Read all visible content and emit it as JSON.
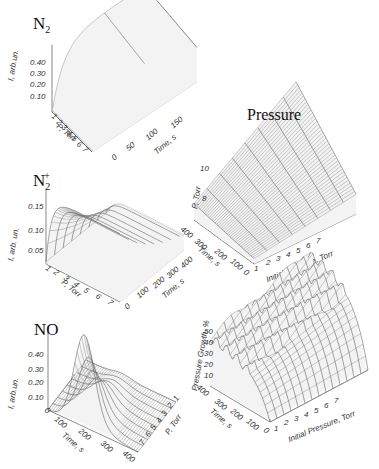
{
  "figure": {
    "width": 379,
    "height": 469,
    "colors": {
      "surface_line": "#8a8a8a",
      "surface_fill": "#f3f3f3",
      "axis": "#555555",
      "dark_contour": "#222222"
    }
  },
  "chart_data": [
    {
      "id": "n2",
      "type": "surface3d",
      "title": "N2",
      "title_main": "N",
      "title_sub": "2",
      "zlabel": "I, arb.un.",
      "xlabel": "Time, s",
      "ylabel": "P, Torr",
      "z_ticks": [
        "0.10",
        "0.20",
        "0.30",
        "0.40"
      ],
      "x_ticks": [
        "0",
        "50",
        "100",
        "150"
      ],
      "y_ticks": [
        "1",
        "2",
        "3",
        "4",
        "5",
        "6",
        "7"
      ],
      "zlim": [
        0,
        0.45
      ],
      "xlim": [
        0,
        180
      ],
      "ylim": [
        1,
        7
      ],
      "shape": "rise-plateau",
      "note": "Intensity rises quickly then plateaus; higher at low pressure"
    },
    {
      "id": "n2plus",
      "type": "surface3d",
      "title": "N2+",
      "title_main": "N",
      "title_sub": "2",
      "title_sup": "+",
      "zlabel": "I, arb. un.",
      "xlabel": "Time, s",
      "ylabel": "P, Torr",
      "z_ticks": [
        "0.05",
        "0.10",
        "0.15"
      ],
      "x_ticks": [
        "0",
        "100",
        "200",
        "300",
        "400"
      ],
      "y_ticks": [
        "1",
        "2",
        "3",
        "4",
        "5",
        "6",
        "7"
      ],
      "zlim": [
        0,
        0.17
      ],
      "xlim": [
        0,
        400
      ],
      "ylim": [
        1,
        7
      ],
      "shape": "decay",
      "note": "Intensity peaks at start then decays with time"
    },
    {
      "id": "no",
      "type": "surface3d",
      "title": "NO",
      "zlabel": "I, arb.un.",
      "xlabel": "Time, s",
      "ylabel": "P, Torr",
      "z_ticks": [
        "0.10",
        "0.20",
        "0.30",
        "0.40"
      ],
      "x_ticks": [
        "0",
        "100",
        "200",
        "300",
        "400"
      ],
      "y_ticks": [
        "1",
        "2",
        "3",
        "4",
        "5",
        "6",
        "7"
      ],
      "zlim": [
        0,
        0.45
      ],
      "xlim": [
        0,
        400
      ],
      "ylim": [
        1,
        7
      ],
      "shape": "peak",
      "note": "Sharp peak near low pressure, mid time"
    },
    {
      "id": "pressure",
      "type": "surface3d",
      "title": "Pressure",
      "zlabel": "P, Torr",
      "xlabel": "Initial Pressure, Torr",
      "ylabel": "Time, s",
      "z_ticks": [
        "8",
        "10"
      ],
      "x_ticks": [
        "1",
        "2",
        "3",
        "4",
        "5",
        "6",
        "7"
      ],
      "y_ticks": [
        "0",
        "100",
        "200",
        "300",
        "400"
      ],
      "zlim": [
        0,
        10
      ],
      "xlim": [
        1,
        7
      ],
      "ylim": [
        0,
        400
      ],
      "shape": "ramp",
      "note": "Pressure rises with initial pressure and time"
    },
    {
      "id": "pressure_growth",
      "type": "surface3d",
      "title": "",
      "zlabel": "Pressure Growth, %",
      "xlabel": "Initial Pressure, Torr",
      "ylabel": "Time, s",
      "z_ticks": [
        "10",
        "20",
        "30",
        "40",
        "50"
      ],
      "x_ticks": [
        "1",
        "2",
        "3",
        "4",
        "5",
        "6",
        "7"
      ],
      "y_ticks": [
        "0",
        "100",
        "200",
        "300",
        "400"
      ],
      "zlim": [
        0,
        55
      ],
      "xlim": [
        1,
        7
      ],
      "ylim": [
        0,
        400
      ],
      "shape": "saturating-noisy",
      "note": "Growth saturates near 45-55% with noisy plateau"
    }
  ]
}
